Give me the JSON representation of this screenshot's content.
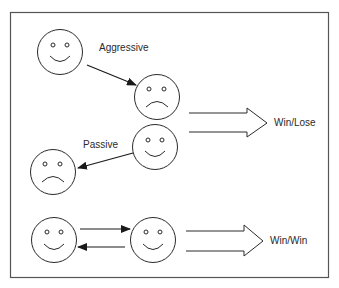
{
  "diagram": {
    "type": "behavior-outcome-diagram",
    "labels": {
      "aggressive": "Aggressive",
      "passive": "Passive",
      "win_lose": "Win/Lose",
      "win_win": "Win/Win"
    },
    "faces": [
      {
        "id": "face-1",
        "expression": "happy",
        "cx": 60,
        "cy": 52
      },
      {
        "id": "face-2",
        "expression": "sad",
        "cx": 157,
        "cy": 97
      },
      {
        "id": "face-3",
        "expression": "happy",
        "cx": 155,
        "cy": 147
      },
      {
        "id": "face-4",
        "expression": "sad",
        "cx": 53,
        "cy": 172
      },
      {
        "id": "face-5",
        "expression": "happy",
        "cx": 54,
        "cy": 240
      },
      {
        "id": "face-6",
        "expression": "happy",
        "cx": 153,
        "cy": 240
      }
    ],
    "relationships": [
      {
        "from": "face-1",
        "to": "face-2",
        "label": "Aggressive"
      },
      {
        "from": "face-3",
        "to": "face-4",
        "label": "Passive"
      },
      {
        "from": "face-5",
        "to": "face-6",
        "label": ""
      },
      {
        "from": "face-6",
        "to": "face-5",
        "label": ""
      }
    ],
    "outcomes": [
      {
        "group": [
          "face-2",
          "face-3"
        ],
        "result": "Win/Lose"
      },
      {
        "group": [
          "face-5",
          "face-6"
        ],
        "result": "Win/Win"
      }
    ],
    "colors": {
      "stroke": "#2a2a2a",
      "frame": "#555555",
      "background": "#ffffff"
    }
  }
}
